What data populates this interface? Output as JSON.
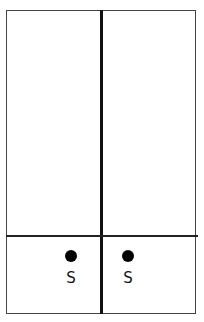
{
  "diagram": {
    "cells": [
      {
        "dot": true,
        "label": "S"
      },
      {
        "dot": true,
        "label": "S"
      }
    ],
    "colors": {
      "line": "#111111",
      "dot": "#000000",
      "background": "#ffffff"
    }
  }
}
